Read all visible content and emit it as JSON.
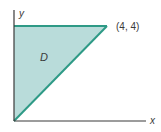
{
  "diagram": {
    "region_label": "D",
    "point_label": "(4, 4)",
    "x_axis_label": "x",
    "y_axis_label": "y",
    "colors": {
      "fill": "#b9dcda",
      "boundary": "#2e9a86",
      "axis": "#3a3a3a",
      "text": "#3a3a3a"
    },
    "vertices": [
      [
        0,
        0
      ],
      [
        0,
        4
      ],
      [
        4,
        4
      ]
    ]
  }
}
